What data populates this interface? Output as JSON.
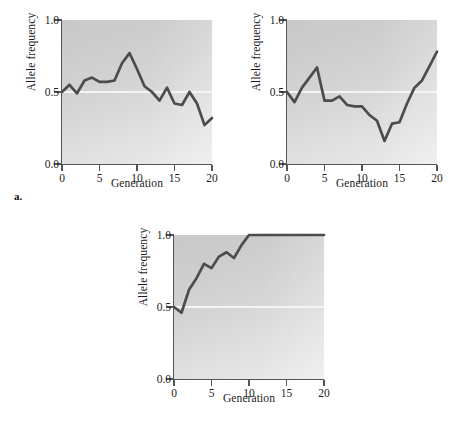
{
  "figure": {
    "name": "genetic-drift-allele-frequency-panels",
    "background_color": "#ffffff",
    "line_color": "#4c4c4c",
    "gridline_color": "#f4f4f4",
    "axis_color": "#555555",
    "plot_bg_light": "#ededed",
    "plot_bg_dark": "#c9c9c9"
  },
  "panels": {
    "a": {
      "letter": "a."
    },
    "b": {
      "letter": "b."
    },
    "c": {
      "letter": "c."
    }
  },
  "chart_data": [
    {
      "id": "a",
      "type": "line",
      "title": "",
      "xlabel": "Generation",
      "ylabel": "Allele frequency",
      "xlim": [
        0,
        20
      ],
      "ylim": [
        0.0,
        1.0
      ],
      "xticks": [
        0,
        5,
        10,
        15,
        20
      ],
      "xticklabels": [
        "0",
        "5",
        "10",
        "15",
        "20"
      ],
      "yticks": [
        0.0,
        0.5,
        1.0
      ],
      "yticklabels": [
        "0.0",
        "0.5",
        "1.0"
      ],
      "grid": "single horizontal gridline at y=0.5",
      "legend": "none",
      "series": [
        {
          "name": "allele frequency",
          "x": [
            0,
            1,
            2,
            3,
            4,
            5,
            6,
            7,
            8,
            9,
            10,
            11,
            12,
            13,
            14,
            15,
            16,
            17,
            18,
            19,
            20
          ],
          "values": [
            0.5,
            0.55,
            0.49,
            0.58,
            0.6,
            0.57,
            0.57,
            0.58,
            0.7,
            0.77,
            0.66,
            0.54,
            0.5,
            0.44,
            0.53,
            0.42,
            0.41,
            0.5,
            0.42,
            0.27,
            0.32
          ]
        }
      ]
    },
    {
      "id": "b",
      "type": "line",
      "title": "",
      "xlabel": "Generation",
      "ylabel": "Allele frequency",
      "xlim": [
        0,
        20
      ],
      "ylim": [
        0.0,
        1.0
      ],
      "xticks": [
        0,
        5,
        10,
        15,
        20
      ],
      "xticklabels": [
        "0",
        "5",
        "10",
        "15",
        "20"
      ],
      "yticks": [
        0.0,
        0.5,
        1.0
      ],
      "yticklabels": [
        "0.0",
        "0.5",
        "1.0"
      ],
      "grid": "single horizontal gridline at y=0.5",
      "legend": "none",
      "series": [
        {
          "name": "allele frequency",
          "x": [
            0,
            1,
            2,
            3,
            4,
            5,
            6,
            7,
            8,
            9,
            10,
            11,
            12,
            13,
            14,
            15,
            16,
            17,
            18,
            19,
            20
          ],
          "values": [
            0.5,
            0.43,
            0.53,
            0.6,
            0.67,
            0.44,
            0.44,
            0.47,
            0.41,
            0.4,
            0.4,
            0.34,
            0.3,
            0.16,
            0.28,
            0.29,
            0.42,
            0.53,
            0.58,
            0.68,
            0.78
          ]
        }
      ]
    },
    {
      "id": "c",
      "type": "line",
      "title": "",
      "xlabel": "Generation",
      "ylabel": "Allele frequency",
      "xlim": [
        0,
        20
      ],
      "ylim": [
        0.0,
        1.0
      ],
      "xticks": [
        0,
        5,
        10,
        15,
        20
      ],
      "xticklabels": [
        "0",
        "5",
        "10",
        "15",
        "20"
      ],
      "yticks": [
        0.0,
        0.5,
        1.0
      ],
      "yticklabels": [
        "0.0",
        "0.5",
        "1.0"
      ],
      "grid": "single horizontal gridline at y=0.5",
      "legend": "none",
      "series": [
        {
          "name": "allele frequency",
          "x": [
            0,
            1,
            2,
            3,
            4,
            5,
            6,
            7,
            8,
            9,
            10,
            11,
            12,
            13,
            14,
            15,
            16,
            17,
            18,
            19,
            20
          ],
          "values": [
            0.5,
            0.46,
            0.62,
            0.7,
            0.8,
            0.77,
            0.85,
            0.88,
            0.84,
            0.93,
            1.0,
            1.0,
            1.0,
            1.0,
            1.0,
            1.0,
            1.0,
            1.0,
            1.0,
            1.0,
            1.0
          ]
        }
      ]
    }
  ]
}
